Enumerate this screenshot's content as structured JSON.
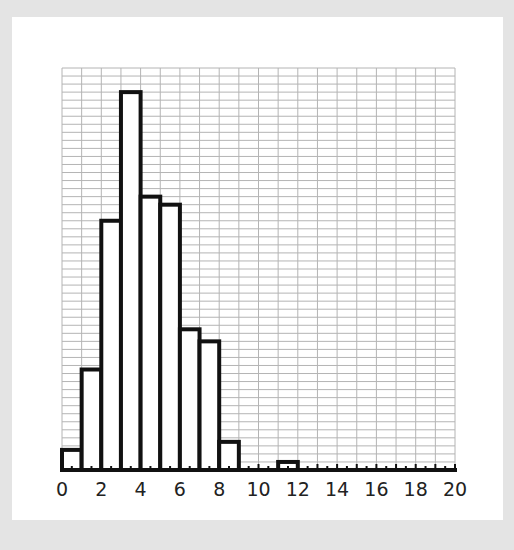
{
  "chart_data": {
    "type": "bar",
    "subtype": "histogram",
    "title": "",
    "xlabel": "",
    "ylabel": "",
    "bins": [
      {
        "start": 0,
        "end": 1,
        "value": 2.5
      },
      {
        "start": 1,
        "end": 2,
        "value": 12.5
      },
      {
        "start": 2,
        "end": 3,
        "value": 31
      },
      {
        "start": 3,
        "end": 4,
        "value": 47
      },
      {
        "start": 4,
        "end": 5,
        "value": 34
      },
      {
        "start": 5,
        "end": 6,
        "value": 33
      },
      {
        "start": 6,
        "end": 7,
        "value": 17.5
      },
      {
        "start": 7,
        "end": 8,
        "value": 16
      },
      {
        "start": 8,
        "end": 9,
        "value": 3.5
      },
      {
        "start": 9,
        "end": 10,
        "value": 0
      },
      {
        "start": 10,
        "end": 11,
        "value": 0
      },
      {
        "start": 11,
        "end": 12,
        "value": 1
      },
      {
        "start": 12,
        "end": 13,
        "value": 0
      },
      {
        "start": 13,
        "end": 14,
        "value": 0
      },
      {
        "start": 14,
        "end": 15,
        "value": 0
      },
      {
        "start": 15,
        "end": 16,
        "value": 0
      },
      {
        "start": 16,
        "end": 17,
        "value": 0
      },
      {
        "start": 17,
        "end": 18,
        "value": 0
      },
      {
        "start": 18,
        "end": 19,
        "value": 0
      },
      {
        "start": 19,
        "end": 20,
        "value": 0
      }
    ],
    "categories": [
      "0-1",
      "1-2",
      "2-3",
      "3-4",
      "4-5",
      "5-6",
      "6-7",
      "7-8",
      "8-9",
      "9-10",
      "10-11",
      "11-12",
      "12-13",
      "13-14",
      "14-15",
      "15-16",
      "16-17",
      "17-18",
      "18-19",
      "19-20"
    ],
    "values": [
      2.5,
      12.5,
      31,
      47,
      34,
      33,
      17.5,
      16,
      3.5,
      0,
      0,
      1,
      0,
      0,
      0,
      0,
      0,
      0,
      0,
      0
    ],
    "xlim": [
      0,
      20
    ],
    "ylim": [
      0,
      50
    ],
    "x_tick_labels": [
      "0",
      "2",
      "4",
      "6",
      "8",
      "10",
      "12",
      "14",
      "16",
      "18",
      "20"
    ],
    "y_tick_labels": [],
    "grid": true,
    "grid_minor_x_step": 1,
    "grid_y_step": 1,
    "legend": null
  },
  "colors": {
    "background": "#e4e4e4",
    "panel": "#ffffff",
    "grid": "#b4b4b4",
    "bar_fill": "#ffffff",
    "bar_stroke": "#111111",
    "axis": "#111111"
  }
}
